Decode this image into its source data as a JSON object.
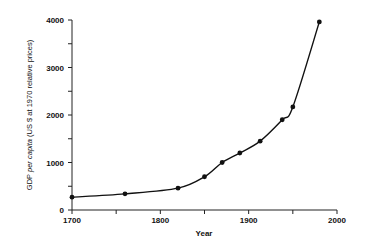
{
  "chart_data": {
    "type": "line",
    "title": "",
    "xlabel": "Year",
    "ylabel_parts": [
      "GDP ",
      "per capita",
      " (US $ at 1970 relative prices)"
    ],
    "ylabel": "GDP per capita (US $ at 1970 relative prices)",
    "xlim": [
      1700,
      2000
    ],
    "ylim": [
      0,
      4000
    ],
    "x_ticks": [
      1700,
      1750,
      1800,
      1850,
      1900,
      1950,
      2000
    ],
    "x_tick_labels": [
      "1700",
      "",
      "1800",
      "",
      "1900",
      "",
      "2000"
    ],
    "y_ticks": [
      0,
      500,
      1000,
      1500,
      2000,
      2500,
      3000,
      3500,
      4000
    ],
    "y_tick_labels": [
      "0",
      "",
      "1000",
      "",
      "2000",
      "",
      "3000",
      "",
      "4000"
    ],
    "grid": false,
    "legend": null,
    "series": [
      {
        "name": "GDP per capita",
        "x": [
          1700,
          1760,
          1820,
          1850,
          1870,
          1890,
          1913,
          1938,
          1950,
          1980
        ],
        "values": [
          270,
          340,
          460,
          700,
          1000,
          1200,
          1450,
          1900,
          2170,
          3960
        ]
      }
    ]
  }
}
